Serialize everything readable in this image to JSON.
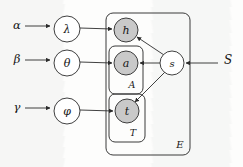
{
  "figure": {
    "type": "plate-diagram",
    "colors": {
      "background": "#fdfdfc",
      "stroke": "#2b2b2b",
      "observed_node_fill": "#c9c9c9",
      "latent_node_fill": "#ffffff",
      "plate_stroke": "#3a3a3a"
    }
  },
  "hyperparameters": [
    {
      "id": "alpha",
      "label": "α",
      "x": 17,
      "y": 29
    },
    {
      "id": "beta",
      "label": "β",
      "x": 17,
      "y": 63
    },
    {
      "id": "gamma",
      "label": "γ",
      "x": 17,
      "y": 111
    },
    {
      "id": "S",
      "label": "S",
      "x": 228,
      "y": 64
    }
  ],
  "nodes": [
    {
      "id": "lambda",
      "label": "λ",
      "x": 67,
      "y": 29,
      "r": 13,
      "observed": false
    },
    {
      "id": "theta",
      "label": "θ",
      "x": 67,
      "y": 63,
      "r": 13,
      "observed": false
    },
    {
      "id": "phi",
      "label": "φ",
      "x": 67,
      "y": 111,
      "r": 13,
      "observed": false
    },
    {
      "id": "h",
      "label": "h",
      "x": 126,
      "y": 30,
      "r": 12,
      "observed": true
    },
    {
      "id": "a",
      "label": "a",
      "x": 126,
      "y": 63,
      "r": 12,
      "observed": true
    },
    {
      "id": "t",
      "label": "t",
      "x": 127,
      "y": 111,
      "r": 12,
      "observed": true
    },
    {
      "id": "s",
      "label": "s",
      "x": 172,
      "y": 63,
      "r": 12,
      "observed": false
    }
  ],
  "plates": [
    {
      "id": "A",
      "label": "A",
      "x": 109,
      "y": 46,
      "w": 34,
      "h": 48,
      "label_x": 132,
      "label_y": 88
    },
    {
      "id": "T",
      "label": "T",
      "x": 109,
      "y": 94,
      "w": 36,
      "h": 48,
      "label_x": 133,
      "label_y": 136
    },
    {
      "id": "E",
      "label": "E",
      "x": 106,
      "y": 13,
      "w": 84,
      "h": 142,
      "label_x": 180,
      "label_y": 148
    }
  ],
  "edges": [
    {
      "id": "alpha-lambda",
      "from": "alpha",
      "to": "lambda"
    },
    {
      "id": "beta-theta",
      "from": "beta",
      "to": "theta"
    },
    {
      "id": "gamma-phi",
      "from": "gamma",
      "to": "phi"
    },
    {
      "id": "lambda-h",
      "from": "lambda",
      "to": "h"
    },
    {
      "id": "theta-a",
      "from": "theta",
      "to": "a"
    },
    {
      "id": "phi-t",
      "from": "phi",
      "to": "t"
    },
    {
      "id": "s-h",
      "from": "s",
      "to": "h"
    },
    {
      "id": "s-a",
      "from": "s",
      "to": "a"
    },
    {
      "id": "s-t",
      "from": "s",
      "to": "t"
    },
    {
      "id": "S-s",
      "from": "S",
      "to": "s"
    }
  ]
}
